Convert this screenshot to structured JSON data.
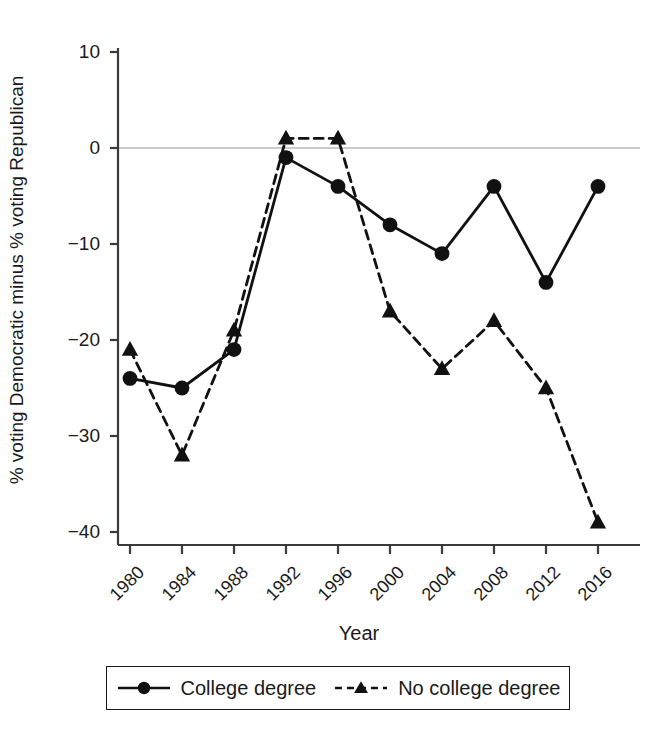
{
  "chart_data": {
    "type": "line",
    "title": "",
    "xlabel": "Year",
    "ylabel": "% voting Democratic minus % voting Republican",
    "categories": [
      "1980",
      "1984",
      "1988",
      "1992",
      "1996",
      "2000",
      "2004",
      "2008",
      "2012",
      "2016"
    ],
    "xlim": [
      1980,
      2016
    ],
    "ylim": [
      -40,
      10
    ],
    "yticks": [
      10,
      0,
      -10,
      -20,
      -30,
      -40
    ],
    "ytick_labels": [
      "10",
      "0",
      "−10",
      "−20",
      "−30",
      "−40"
    ],
    "grid": false,
    "zero_line": true,
    "legend_position": "below",
    "series": [
      {
        "name": "College degree",
        "marker": "circle",
        "linestyle": "solid",
        "color": "#111111",
        "values": [
          -24,
          -25,
          -21,
          -1,
          -4,
          -8,
          -11,
          -4,
          -14,
          -4
        ]
      },
      {
        "name": "No college degree",
        "marker": "triangle",
        "linestyle": "dashed",
        "color": "#111111",
        "values": [
          -21,
          -32,
          -19,
          1,
          1,
          -17,
          -23,
          -18,
          -25,
          -39
        ]
      }
    ]
  },
  "axes": {
    "y_title": "% voting Democratic minus % voting Republican",
    "x_title": "Year"
  },
  "legend": {
    "entries": [
      {
        "label": "College degree",
        "key": "solid-line-circle-marker"
      },
      {
        "label": "No college degree",
        "key": "dashed-line-triangle-marker"
      }
    ]
  },
  "colors": {
    "ink": "#111111",
    "axis": "#444444",
    "zero_line": "#b8b8b8",
    "background": "#ffffff"
  }
}
